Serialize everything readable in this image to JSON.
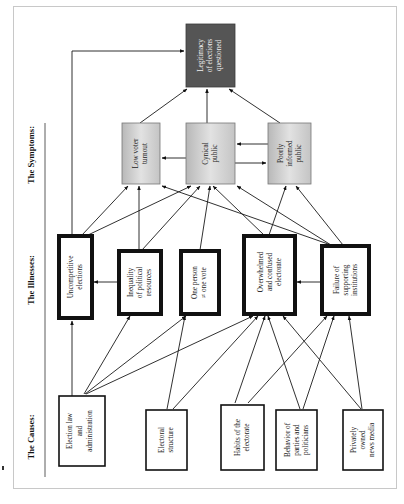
{
  "headings": {
    "causes": "The Causes:",
    "illnesses": "The Illnesses:",
    "symptoms": "The Symptoms:"
  },
  "result": {
    "lines": [
      "Legitimacy",
      "of elections",
      "questioned"
    ],
    "color": "#555555"
  },
  "symptoms": [
    {
      "id": "low-voter-turnout",
      "lines": [
        "Low voter",
        "turnout"
      ]
    },
    {
      "id": "cynical-public",
      "lines": [
        "Cynical",
        "public"
      ]
    },
    {
      "id": "poorly-informed-public",
      "lines": [
        "Poorly",
        "informed",
        "public"
      ]
    }
  ],
  "illnesses": [
    {
      "id": "uncompetitive-elections",
      "lines": [
        "Uncompetitive",
        "elections"
      ]
    },
    {
      "id": "inequality-of-political-resources",
      "lines": [
        "Inequality",
        "of political",
        "resources"
      ]
    },
    {
      "id": "one-person-not-one-vote",
      "lines": [
        "One person",
        "≠ one vote"
      ]
    },
    {
      "id": "overwhelmed-and-confused-electorate",
      "lines": [
        "Overwhelmed",
        "and confused",
        "electorate"
      ]
    },
    {
      "id": "failure-of-supporting-institutions",
      "lines": [
        "Failure of",
        "supporting",
        "institutions"
      ]
    }
  ],
  "causes": [
    {
      "id": "election-law-and-administration",
      "lines": [
        "Election law",
        "and",
        "administration"
      ]
    },
    {
      "id": "electoral-structure",
      "lines": [
        "Electoral",
        "structure"
      ]
    },
    {
      "id": "habits-of-the-electorate",
      "lines": [
        "Habits of the",
        "electorate"
      ]
    },
    {
      "id": "behavior-of-parties-and-politicians",
      "lines": [
        "Behavior of",
        "parties and",
        "politicians"
      ]
    },
    {
      "id": "privately-owned-news-media",
      "lines": [
        "Privately",
        "owned",
        "news media"
      ]
    }
  ],
  "colors": {
    "symptom_gradient_light": "#e6e6e6",
    "symptom_gradient_dark": "#b8b8b8",
    "result_fill": "#555555"
  }
}
